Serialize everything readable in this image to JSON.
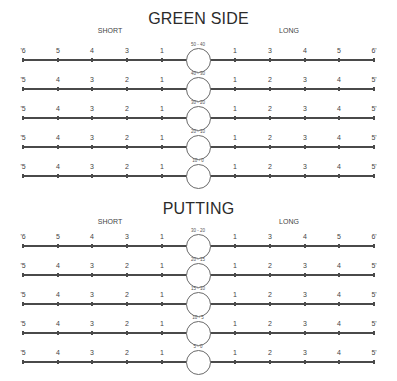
{
  "sections": [
    {
      "title": "GREEN SIDE",
      "short_label": "SHORT",
      "long_label": "LONG",
      "rows": [
        {
          "range": "50 - 40",
          "left": [
            "'6",
            "5",
            "4",
            "3",
            "1"
          ],
          "right": [
            "1",
            "3",
            "4",
            "5",
            "6'"
          ]
        },
        {
          "range": "40 - 30",
          "left": [
            "'5",
            "4",
            "3",
            "2",
            "1"
          ],
          "right": [
            "1",
            "2",
            "3",
            "4",
            "5'"
          ]
        },
        {
          "range": "30 - 20",
          "left": [
            "'5",
            "4",
            "3",
            "2",
            "1"
          ],
          "right": [
            "1",
            "2",
            "3",
            "4",
            "5'"
          ]
        },
        {
          "range": "20 - 10",
          "left": [
            "'5",
            "4",
            "3",
            "2",
            "1"
          ],
          "right": [
            "1",
            "2",
            "3",
            "4",
            "5'"
          ]
        },
        {
          "range": "10 - 0",
          "left": [
            "'5",
            "4",
            "3",
            "2",
            "1"
          ],
          "right": [
            "1",
            "2",
            "3",
            "4",
            "5'"
          ]
        }
      ]
    },
    {
      "title": "PUTTING",
      "short_label": "SHORT",
      "long_label": "LONG",
      "rows": [
        {
          "range": "30 - 20",
          "left": [
            "'6",
            "5",
            "4",
            "3",
            "1"
          ],
          "right": [
            "1",
            "3",
            "4",
            "5",
            "6'"
          ]
        },
        {
          "range": "20 - 15",
          "left": [
            "'5",
            "4",
            "3",
            "2",
            "1"
          ],
          "right": [
            "1",
            "2",
            "3",
            "4",
            "5'"
          ]
        },
        {
          "range": "15 - 10",
          "left": [
            "'5",
            "4",
            "3",
            "2",
            "1"
          ],
          "right": [
            "1",
            "2",
            "3",
            "4",
            "5'"
          ]
        },
        {
          "range": "10 - 5",
          "left": [
            "'5",
            "4",
            "3",
            "2",
            "1"
          ],
          "right": [
            "1",
            "2",
            "3",
            "4",
            "5'"
          ]
        },
        {
          "range": "5 - 0",
          "left": [
            "'5",
            "4",
            "3",
            "2",
            "1"
          ],
          "right": [
            "1",
            "2",
            "3",
            "4",
            "5'"
          ]
        }
      ]
    }
  ]
}
